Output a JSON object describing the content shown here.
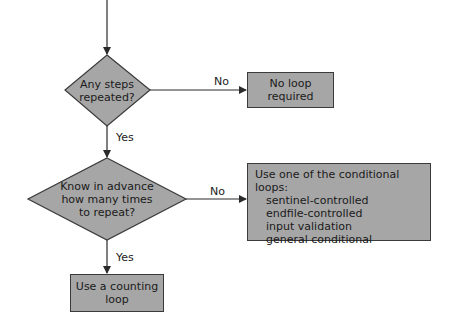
{
  "diagram": {
    "type": "flowchart",
    "colors": {
      "shape_fill": "#a6a6a6",
      "stroke": "#3a3a3a",
      "text": "#1a1a1a",
      "background": "#ffffff"
    },
    "nodes": [
      {
        "id": "d1",
        "shape": "diamond",
        "lines": [
          "Any steps",
          "repeated?"
        ]
      },
      {
        "id": "b1",
        "shape": "rectangle",
        "lines": [
          "No loop",
          "required"
        ]
      },
      {
        "id": "d2",
        "shape": "diamond",
        "lines": [
          "Know in advance",
          "how many times",
          "to repeat?"
        ]
      },
      {
        "id": "b2",
        "shape": "rectangle",
        "title": "Use one of the conditional loops:",
        "items": [
          "sentinel-controlled",
          "endfile-controlled",
          "input validation",
          "general conditional"
        ]
      },
      {
        "id": "b3",
        "shape": "rectangle",
        "lines": [
          "Use a counting",
          "loop"
        ]
      }
    ],
    "edges": [
      {
        "from": "start",
        "to": "d1",
        "label": ""
      },
      {
        "from": "d1",
        "to": "b1",
        "label": "No"
      },
      {
        "from": "d1",
        "to": "d2",
        "label": "Yes"
      },
      {
        "from": "d2",
        "to": "b2",
        "label": "No"
      },
      {
        "from": "d2",
        "to": "b3",
        "label": "Yes"
      }
    ]
  }
}
